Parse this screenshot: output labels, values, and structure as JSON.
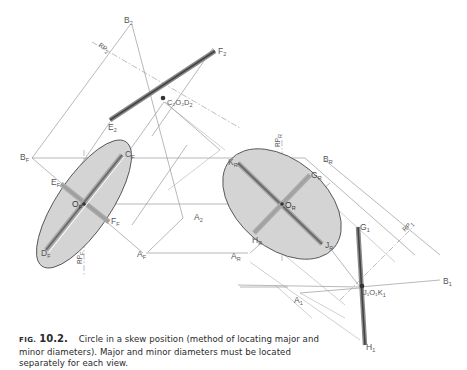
{
  "figure": {
    "label": "FIG.",
    "number": "10.2.",
    "caption": "Circle in a skew position (method of locating major and minor diameters). Major and minor diameters must be located separately for each view."
  },
  "views": {
    "top": {
      "labels": {
        "B": {
          "main": "B",
          "sub": "2"
        },
        "RP": {
          "main": "RP",
          "sub": "2"
        },
        "F": {
          "main": "F",
          "sub": "2"
        },
        "CD": {
          "main": "C₂O₂D",
          "sub": "2"
        },
        "E": {
          "main": "E",
          "sub": "2"
        },
        "A": {
          "main": "A",
          "sub": "2"
        }
      }
    },
    "front": {
      "labels": {
        "B": {
          "main": "B",
          "sub": "F"
        },
        "C": {
          "main": "C",
          "sub": "F"
        },
        "E": {
          "main": "E",
          "sub": "F"
        },
        "O": {
          "main": "O",
          "sub": "F"
        },
        "F": {
          "main": "F",
          "sub": "F"
        },
        "D": {
          "main": "D",
          "sub": "F"
        },
        "RP": {
          "main": "RP",
          "sub": "F"
        },
        "A": {
          "main": "A",
          "sub": "F"
        }
      }
    },
    "right": {
      "labels": {
        "RP": {
          "main": "RP",
          "sub": "R"
        },
        "K": {
          "main": "K",
          "sub": "R"
        },
        "B": {
          "main": "B",
          "sub": "R"
        },
        "G": {
          "main": "G",
          "sub": "R"
        },
        "O": {
          "main": "O",
          "sub": "R"
        },
        "H": {
          "main": "H",
          "sub": "R"
        },
        "J": {
          "main": "J",
          "sub": "R"
        },
        "A": {
          "main": "A",
          "sub": "R"
        }
      }
    },
    "auxiliary": {
      "labels": {
        "G": {
          "main": "G",
          "sub": "1"
        },
        "RP": {
          "main": "RP",
          "sub": "1"
        },
        "B": {
          "main": "B",
          "sub": "1"
        },
        "A": {
          "main": "A",
          "sub": "1"
        },
        "OK": {
          "main": "J₁O₁K",
          "sub": "1"
        },
        "H": {
          "main": "H",
          "sub": "1"
        }
      }
    }
  },
  "colors": {
    "ellipse_fill": "#d4d4d4",
    "ellipse_stroke": "#555555",
    "construction_line": "#9a9a9a",
    "diameter_dark": "#6a6a6a",
    "text": "#555555"
  }
}
